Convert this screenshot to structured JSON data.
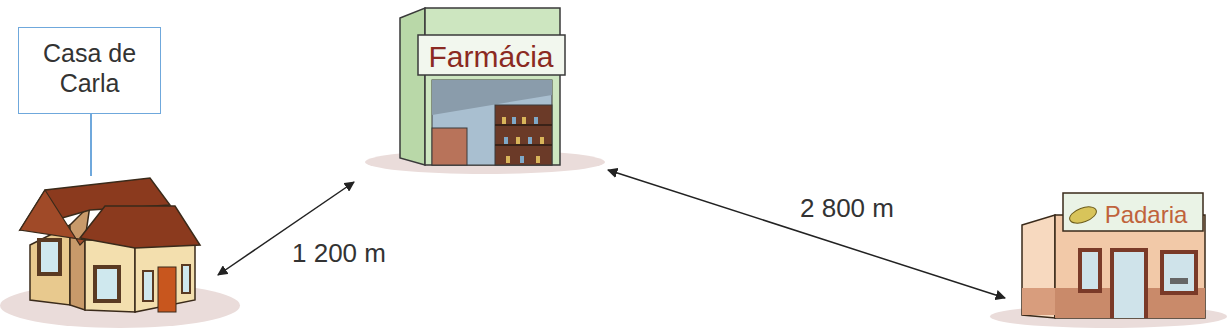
{
  "places": {
    "house": {
      "label_line1": "Casa de",
      "label_line2": "Carla"
    },
    "pharmacy": {
      "sign": "Farmácia"
    },
    "bakery": {
      "sign": "Padaria"
    }
  },
  "distances": {
    "house_to_pharmacy": "1 200 m",
    "pharmacy_to_bakery": "2 800 m"
  },
  "colors": {
    "label_border": "#6fa8dc",
    "roof": "#8b3a1e",
    "house_wall": "#f3dfae",
    "pharmacy_wall": "#cde6c0",
    "sign_text_pharmacy": "#8b2a22",
    "bakery_wall": "#f2c9a8",
    "sign_text_bakery": "#c0633c"
  }
}
